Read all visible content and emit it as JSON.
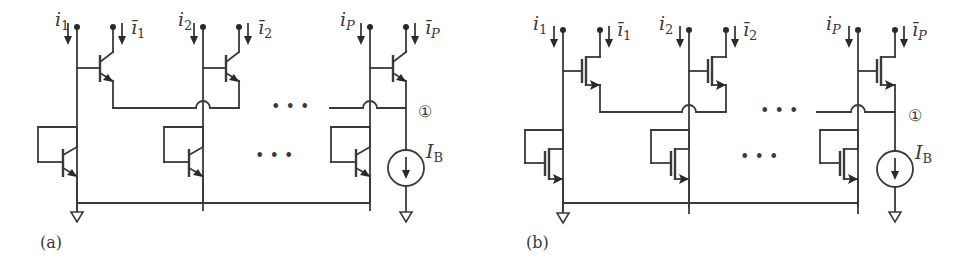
{
  "figure": {
    "panels": [
      {
        "id": "a",
        "caption": "(a)",
        "device_type": "bipolar (BJT)",
        "cells": [
          {
            "input_label": "i",
            "input_sub": "1",
            "output_label": "ī",
            "output_sub": "1"
          },
          {
            "input_label": "i",
            "input_sub": "2",
            "output_label": "ī",
            "output_sub": "2"
          },
          {
            "input_label": "i",
            "input_sub": "P",
            "output_label": "ī",
            "output_sub": "P"
          }
        ],
        "ellipsis": "• • •",
        "node_label": "①",
        "bias_label": "I",
        "bias_sub": "B"
      },
      {
        "id": "b",
        "caption": "(b)",
        "device_type": "MOS (MOSFET)",
        "cells": [
          {
            "input_label": "i",
            "input_sub": "1",
            "output_label": "ī",
            "output_sub": "1"
          },
          {
            "input_label": "i",
            "input_sub": "2",
            "output_label": "ī",
            "output_sub": "2"
          },
          {
            "input_label": "i",
            "input_sub": "P",
            "output_label": "ī",
            "output_sub": "P"
          }
        ],
        "ellipsis": "• • •",
        "node_label": "①",
        "bias_label": "I",
        "bias_sub": "B"
      }
    ]
  }
}
